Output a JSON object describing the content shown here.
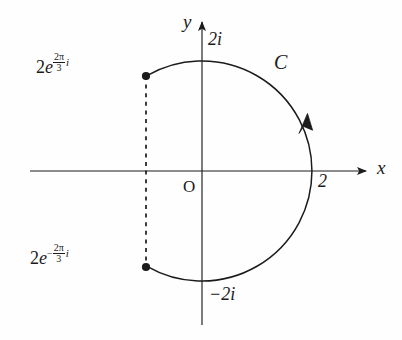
{
  "figure": {
    "type": "complex-plane-contour-diagram",
    "background_color": "#fefefe",
    "ink_color": "#1b1b1b"
  },
  "axes": {
    "x_label": "x",
    "y_label": "y",
    "origin_label": "O",
    "x_axis": {
      "start_x": 30,
      "end_x": 368,
      "y": 171,
      "arrow": "right"
    },
    "y_axis": {
      "x": 202,
      "start_y": 325,
      "end_y": 20,
      "arrow": "up"
    }
  },
  "circle": {
    "center_x": 202,
    "center_y": 171,
    "radius": 110,
    "radius_value": 2
  },
  "ticks": [
    {
      "name": "x-tick-2",
      "label": "2",
      "x": 318,
      "y": 180
    },
    {
      "name": "y-tick-2i",
      "label": "2i",
      "x": 208,
      "y": 34
    },
    {
      "name": "y-tick-minus-2i",
      "label": "−2i",
      "x": 209,
      "y": 288
    }
  ],
  "curve": {
    "label": "C",
    "label_x": 274,
    "label_y": 56,
    "orientation": "counterclockwise",
    "arrow_x": 305,
    "arrow_y": 120
  },
  "points": [
    {
      "name": "point-upper",
      "angle_degrees": 120,
      "x": 146,
      "y": 76,
      "label": {
        "coefficient": "2",
        "base": "e",
        "sign": "",
        "numerator": "2π",
        "denominator": "3",
        "imaginary_unit": "i",
        "plain": "2e^(2π/3 i)",
        "label_x": 36,
        "label_y": 60
      }
    },
    {
      "name": "point-lower",
      "angle_degrees": -120,
      "x": 146,
      "y": 267,
      "label": {
        "coefficient": "2",
        "base": "e",
        "sign": "−",
        "numerator": "2π",
        "denominator": "3",
        "imaginary_unit": "i",
        "plain": "2e^(−2π/3 i)",
        "label_x": 30,
        "label_y": 251
      }
    }
  ],
  "chord": {
    "name": "dashed-chord",
    "x": 146,
    "y_top": 76,
    "y_bottom": 267,
    "style": "dashed"
  }
}
